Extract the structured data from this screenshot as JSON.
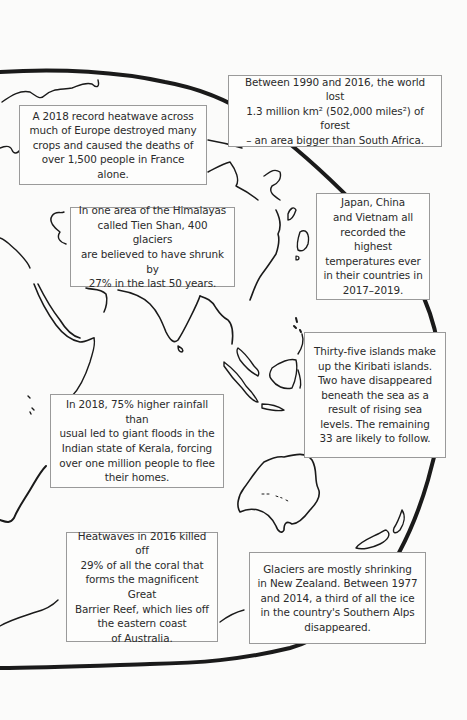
{
  "page": {
    "background": "#fbfbfa",
    "outline_color": "#1a1a1a",
    "box_border_color": "#9a9a9a"
  },
  "map": {
    "description": "Hand-drawn outline map of Europe, Asia, Indian Ocean and Australia on a globe",
    "icon": "world-map-outline"
  },
  "facts": [
    {
      "id": "forest-loss",
      "text": "Between 1990 and 2016, the world lost\n1.3 million km² (502,000 miles²) of forest\n– an area bigger than South Africa."
    },
    {
      "id": "europe-heatwave",
      "text": "A 2018 record heatwave across\nmuch of Europe destroyed many\ncrops and caused the deaths of\nover 1,500 people in France alone."
    },
    {
      "id": "himalaya-glaciers",
      "text": "In one area of the Himalayas\ncalled Tien Shan, 400 glaciers\nare believed to have shrunk by\n27% in the last 50 years."
    },
    {
      "id": "asia-temperatures",
      "text": "Japan, China\nand Vietnam all\nrecorded the highest\ntemperatures ever\nin their countries in\n2017–2019."
    },
    {
      "id": "kiribati-islands",
      "text": "Thirty-five islands make\nup the Kiribati islands.\nTwo have disappeared\nbeneath the sea as a\nresult of rising sea\nlevels. The remaining\n33 are likely to follow."
    },
    {
      "id": "kerala-floods",
      "text": "In 2018, 75% higher rainfall than\nusual led to giant floods in the\nIndian state of Kerala, forcing\nover one million people to flee\ntheir homes."
    },
    {
      "id": "great-barrier-reef",
      "text": "Heatwaves in 2016 killed off\n29% of all the coral that\nforms the magnificent Great\nBarrier Reef, which lies off\nthe eastern coast\nof Australia."
    },
    {
      "id": "new-zealand-glaciers",
      "text": "Glaciers are mostly shrinking\nin New Zealand. Between 1977\nand 2014, a third of all the ice\nin the country's Southern Alps\ndisappeared."
    }
  ]
}
